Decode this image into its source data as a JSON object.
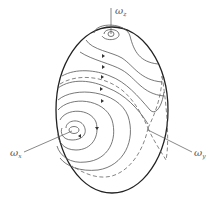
{
  "diagram": {
    "type": "phase-portrait",
    "labels": {
      "top": {
        "symbol": "ω",
        "subscript": "z"
      },
      "left": {
        "symbol": "ω",
        "subscript": "x"
      },
      "right": {
        "symbol": "ω",
        "subscript": "y"
      }
    },
    "colors": {
      "outline": "#222222",
      "curves": "#555555",
      "dashed": "#666666"
    }
  }
}
